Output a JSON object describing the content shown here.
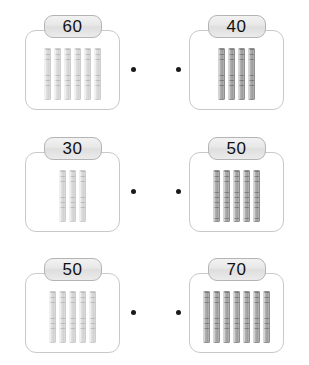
{
  "worksheet": {
    "type": "matching-base-ten-rods",
    "rod_unit_value": 10,
    "rod_segments": 10,
    "connector_dot": "connector-dot",
    "rows": [
      {
        "left": {
          "value": "60",
          "rods": 6,
          "shade": "light"
        },
        "right": {
          "value": "40",
          "rods": 4,
          "shade": "dark"
        }
      },
      {
        "left": {
          "value": "30",
          "rods": 3,
          "shade": "light"
        },
        "right": {
          "value": "50",
          "rods": 5,
          "shade": "dark"
        }
      },
      {
        "left": {
          "value": "50",
          "rods": 5,
          "shade": "light"
        },
        "right": {
          "value": "70",
          "rods": 7,
          "shade": "dark"
        }
      }
    ],
    "colors": {
      "background": "#ffffff",
      "card_border": "#c9c9c9",
      "badge_border": "#b4b4b4",
      "badge_fill": "#e8e8e8",
      "badge_text": "#111111",
      "rod_light": "#d6d6d6",
      "rod_dark": "#a3a3a3",
      "dot": "#1a1a1a"
    }
  }
}
